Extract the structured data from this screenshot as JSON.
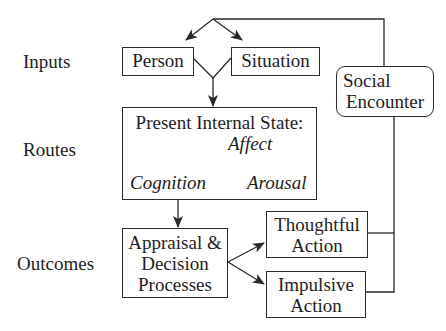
{
  "diagram": {
    "row_labels": {
      "inputs": "Inputs",
      "routes": "Routes",
      "outcomes": "Outcomes"
    },
    "nodes": {
      "person": "Person",
      "situation": "Situation",
      "social_encounter": [
        "Social",
        "Encounter"
      ],
      "internal_state": {
        "title": "Present Internal State:",
        "affect": "Affect",
        "cognition": "Cognition",
        "arousal": "Arousal"
      },
      "appraisal": [
        "Appraisal &",
        "Decision",
        "Processes"
      ],
      "thoughtful_action": [
        "Thoughtful",
        "Action"
      ],
      "impulsive_action": [
        "Impulsive",
        "Action"
      ]
    },
    "edges": [
      {
        "from": "social_encounter",
        "to": "person"
      },
      {
        "from": "social_encounter",
        "to": "situation"
      },
      {
        "from": "person",
        "to": "internal_state"
      },
      {
        "from": "situation",
        "to": "internal_state"
      },
      {
        "from": "internal_state",
        "to": "appraisal"
      },
      {
        "from": "appraisal",
        "to": "thoughtful_action"
      },
      {
        "from": "appraisal",
        "to": "impulsive_action"
      },
      {
        "from": "thoughtful_action",
        "to": "social_encounter"
      },
      {
        "from": "impulsive_action",
        "to": "social_encounter"
      }
    ],
    "line_color": "#2a2a2a"
  }
}
